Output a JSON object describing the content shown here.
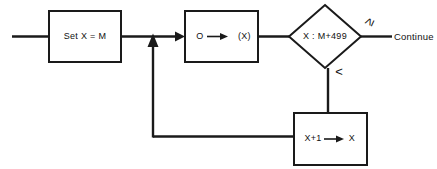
{
  "diagram": {
    "background_color": "#ffffff",
    "line_color": "#1a1a1a",
    "nodes": {
      "entry_line": {
        "name": "entry"
      },
      "set_box": {
        "label": "Set  X = M",
        "shape": "rectangle"
      },
      "zero_box": {
        "label_left": "O",
        "label_right": "(X)",
        "shape": "rectangle"
      },
      "decision": {
        "label": "X : M+499",
        "shape": "diamond"
      },
      "increment_box": {
        "label_left": "X+1",
        "label_right": "X",
        "shape": "rectangle"
      }
    },
    "edges": {
      "ge_label": "≥",
      "lt_label": "<",
      "continue_label": "Continue"
    }
  }
}
